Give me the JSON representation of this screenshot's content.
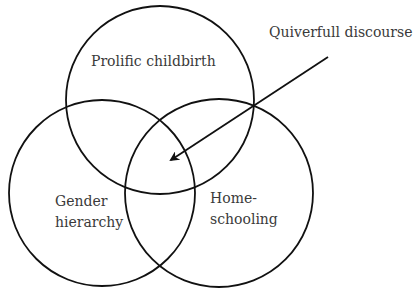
{
  "diagram": {
    "type": "venn",
    "sets": [
      {
        "label": "Prolific childbirth"
      },
      {
        "label_line1": "Gender",
        "label_line2": "hierarchy"
      },
      {
        "label_line1": "Home-",
        "label_line2": "schooling"
      }
    ],
    "annotation": {
      "label": "Quiverfull discourse",
      "points_to": "intersection of all three"
    }
  }
}
